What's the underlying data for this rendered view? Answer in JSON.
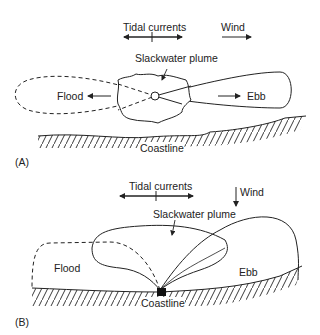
{
  "panel_a": {
    "tag": "(A)",
    "tidal_label": "Tidal currents",
    "wind_label": "Wind",
    "plume_label": "Slackwater plume",
    "flood_label": "Flood",
    "ebb_label": "Ebb",
    "coast_label": "Coastline"
  },
  "panel_b": {
    "tag": "(B)",
    "tidal_label": "Tidal currents",
    "wind_label": "Wind",
    "plume_label": "Slackwater plume",
    "flood_label": "Flood",
    "ebb_label": "Ebb",
    "coast_label": "Coastline"
  }
}
